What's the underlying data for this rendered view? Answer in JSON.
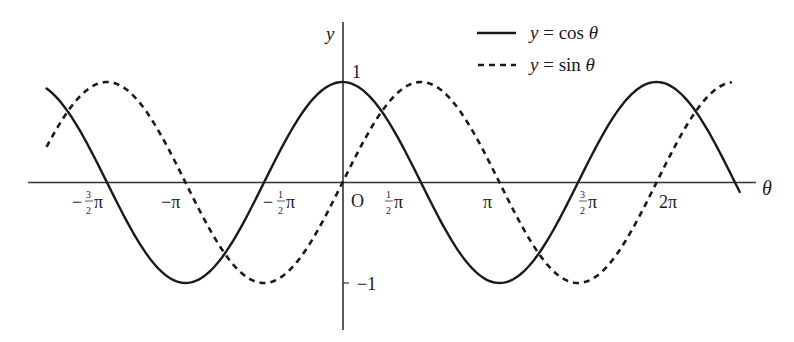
{
  "chart_data": {
    "type": "line",
    "title": "",
    "xlabel": "θ",
    "ylabel": "y",
    "xlim": [
      -1.885,
      2.51
    ],
    "ylim": [
      -1,
      1
    ],
    "x_unit": "π",
    "grid": false,
    "legend_position": "top-right",
    "x_ticks": [
      {
        "value": -1.5,
        "label": "−3/2π"
      },
      {
        "value": -1.0,
        "label": "−π"
      },
      {
        "value": -0.5,
        "label": "−1/2π"
      },
      {
        "value": 0.5,
        "label": "1/2π"
      },
      {
        "value": 1.0,
        "label": "π"
      },
      {
        "value": 1.5,
        "label": "3/2π"
      },
      {
        "value": 2.0,
        "label": "2π"
      }
    ],
    "y_ticks": [
      {
        "value": 1,
        "label": "1"
      },
      {
        "value": -1,
        "label": "−1"
      }
    ],
    "origin_label": "O",
    "series": [
      {
        "name": "y = cos θ",
        "style": "solid",
        "function": "cos",
        "x_range_pi": [
          -1.885,
          2.53
        ]
      },
      {
        "name": "y = sin θ",
        "style": "dashed",
        "function": "sin",
        "x_range_pi": [
          -1.885,
          2.48
        ]
      }
    ]
  },
  "axes": {
    "x_label": "θ",
    "y_label": "y",
    "origin": "O",
    "y_tick_top": "1",
    "y_tick_bottom": "−1"
  },
  "ticks": {
    "neg_three_half_pi": {
      "sign": "−",
      "num": "3",
      "den": "2",
      "pi": "π"
    },
    "neg_pi": "−π",
    "neg_half_pi": {
      "sign": "−",
      "num": "1",
      "den": "2",
      "pi": "π"
    },
    "half_pi": {
      "num": "1",
      "den": "2",
      "pi": "π"
    },
    "pi": "π",
    "three_half_pi": {
      "num": "3",
      "den": "2",
      "pi": "π"
    },
    "two_pi": "2π"
  },
  "legend": {
    "items": [
      {
        "label_y": "y",
        "label_rest": " = cos ",
        "label_theta": "θ"
      },
      {
        "label_y": "y",
        "label_rest": " = sin ",
        "label_theta": "θ"
      }
    ]
  },
  "colors": {
    "stroke": "#1a1a1a",
    "axis": "#333333",
    "background": "#ffffff"
  }
}
